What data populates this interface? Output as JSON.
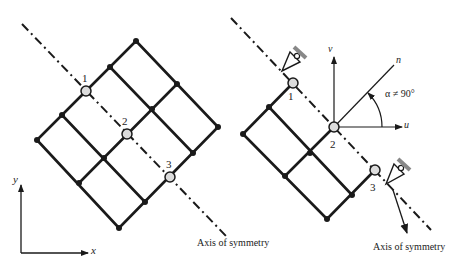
{
  "left_diagram": {
    "title": "Full mesh with axis of symmetry",
    "nodes": [
      {
        "x": 136,
        "y": 41
      },
      {
        "x": 177,
        "y": 84
      },
      {
        "x": 218,
        "y": 127
      },
      {
        "x": 110,
        "y": 67
      },
      {
        "x": 152,
        "y": 109
      },
      {
        "x": 193,
        "y": 153
      },
      {
        "x": 62,
        "y": 115
      },
      {
        "x": 104,
        "y": 158
      },
      {
        "x": 145,
        "y": 202
      },
      {
        "x": 37,
        "y": 140
      },
      {
        "x": 79,
        "y": 183
      },
      {
        "x": 119,
        "y": 228
      }
    ],
    "symmetry_nodes": [
      {
        "label": "1",
        "x": 86,
        "y": 91
      },
      {
        "label": "2",
        "x": 127,
        "y": 134
      },
      {
        "label": "3",
        "x": 170,
        "y": 177
      }
    ],
    "axis_label": "Axis of symmetry",
    "coord_axes": {
      "x_label": "x",
      "y_label": "y"
    }
  },
  "right_diagram": {
    "title": "Half mesh with inclined supports",
    "symmetry_nodes": [
      {
        "label": "1",
        "x": 293,
        "y": 83
      },
      {
        "label": "2",
        "x": 334,
        "y": 127
      },
      {
        "label": "3",
        "x": 375,
        "y": 170
      }
    ],
    "local_axes": {
      "u_label": "u",
      "v_label": "v",
      "n_label": "n"
    },
    "angle_label": "α ≠ 90°",
    "axis_label": "Axis of symmetry"
  },
  "colors": {
    "line": "#1a1a1a",
    "node_fill": "#dcdcdc",
    "hatch": "#888888"
  }
}
